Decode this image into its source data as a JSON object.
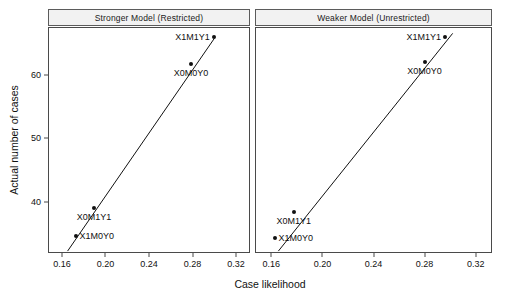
{
  "chart_data": {
    "type": "scatter",
    "title": "",
    "xlabel": "Case likelihood",
    "ylabel": "Actual number of cases",
    "xlim": [
      0.1472,
      0.3328
    ],
    "ylim": [
      32.0,
      67.5
    ],
    "xticks": [
      "0.16",
      "0.20",
      "0.24",
      "0.28",
      "0.32"
    ],
    "xtick_values": [
      0.16,
      0.2,
      0.24,
      0.28,
      0.32
    ],
    "yticks": [
      "40",
      "50",
      "60"
    ],
    "ytick_values": [
      40,
      50,
      60
    ],
    "grid": false,
    "legend": "none",
    "panels": [
      {
        "strip_label": "Stronger Model (Restricted)",
        "points": [
          {
            "label": "X1M1Y1",
            "x": 0.2995,
            "y": 66.0,
            "label_pos": "right"
          },
          {
            "label": "X0M0Y0",
            "x": 0.2785,
            "y": 61.7,
            "label_pos": "above"
          },
          {
            "label": "X0M1Y1",
            "x": 0.1895,
            "y": 39.0,
            "label_pos": "below"
          },
          {
            "label": "X1M0Y0",
            "x": 0.1725,
            "y": 34.7,
            "label_pos": "left"
          }
        ],
        "fit_line": {
          "x0": 0.1652,
          "y0": 32.3,
          "x1": 0.3,
          "y1": 65.7
        }
      },
      {
        "strip_label": "Weaker Model  (Unrestricted)",
        "points": [
          {
            "label": "X1M1Y1",
            "x": 0.296,
            "y": 66.0,
            "label_pos": "right"
          },
          {
            "label": "X0M0Y0",
            "x": 0.28,
            "y": 62.0,
            "label_pos": "below"
          },
          {
            "label": "X0M1Y1",
            "x": 0.1775,
            "y": 38.4,
            "label_pos": "below"
          },
          {
            "label": "X1M0Y0",
            "x": 0.1625,
            "y": 34.4,
            "label_pos": "left"
          }
        ],
        "fit_line": {
          "x0": 0.1655,
          "y0": 32.3,
          "x1": 0.302,
          "y1": 66.5
        }
      }
    ]
  },
  "geometry": {
    "strip_height": 17,
    "plot_top": 27,
    "plot_bottom": 253,
    "panel1_left": 48,
    "panel1_right": 250,
    "panel2_left": 255,
    "panel2_right": 492
  },
  "colors": {
    "point": "#111111",
    "line": "#111111",
    "axis": "#4a4a4a",
    "strip_fill": "#f2f2f2",
    "strip_border": "#5b5b5b",
    "background": "#ffffff"
  }
}
